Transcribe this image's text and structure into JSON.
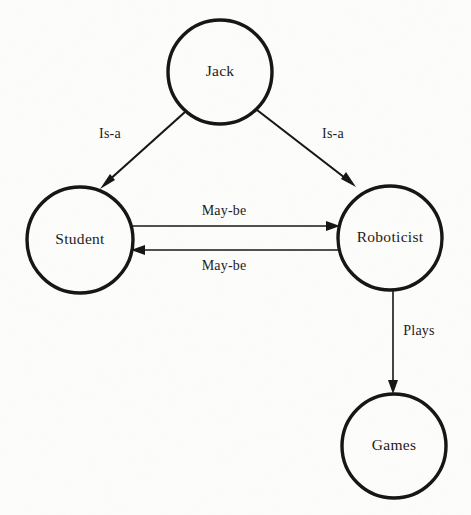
{
  "diagram": {
    "background_color": "#fdfdfc",
    "stroke_color": "#141414",
    "text_color": "#1a1a1a",
    "nodes": [
      {
        "id": "jack",
        "label": "Jack",
        "cx": 220,
        "cy": 72,
        "r": 52
      },
      {
        "id": "student",
        "label": "Student",
        "cx": 80,
        "cy": 240,
        "r": 53
      },
      {
        "id": "roboticist",
        "label": "Roboticist",
        "cx": 390,
        "cy": 238,
        "r": 52
      },
      {
        "id": "games",
        "label": "Games",
        "cx": 394,
        "cy": 446,
        "r": 52
      }
    ],
    "edges": [
      {
        "id": "jack-student",
        "label": "Is-a",
        "from": "jack",
        "to": "student",
        "label_x": 110,
        "label_y": 135
      },
      {
        "id": "jack-roboticist",
        "label": "Is-a",
        "from": "jack",
        "to": "roboticist",
        "label_x": 333,
        "label_y": 135
      },
      {
        "id": "student-roboticist",
        "label": "May-be",
        "from": "student",
        "to": "roboticist",
        "label_x": 224,
        "label_y": 212
      },
      {
        "id": "roboticist-student",
        "label": "May-be",
        "from": "roboticist",
        "to": "student",
        "label_x": 224,
        "label_y": 267
      },
      {
        "id": "roboticist-games",
        "label": "Plays",
        "from": "roboticist",
        "to": "games",
        "label_x": 419,
        "label_y": 332
      }
    ]
  }
}
